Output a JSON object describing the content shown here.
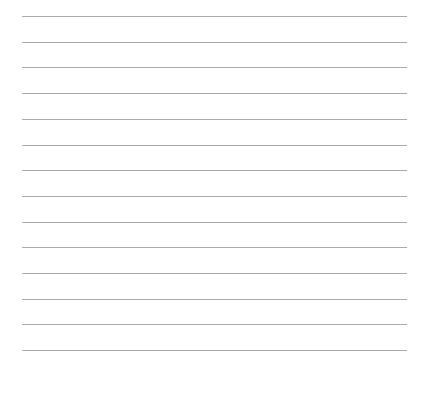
{
  "sheet": {
    "type": "ruled-lines",
    "line_count": 14,
    "first_line_y": 16,
    "line_spacing": 25.7,
    "line_left": 22,
    "line_right": 407,
    "line_color": "#ababab",
    "background_color": "#ffffff"
  }
}
